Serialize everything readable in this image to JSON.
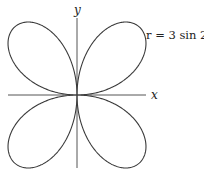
{
  "figure": {
    "equation_label": "r = 3 sin 2θ",
    "x_axis_label": "x",
    "y_axis_label": "y",
    "curve": {
      "type": "polar-rose",
      "expression": "r = 3 sin 2θ",
      "petals": 4,
      "amplitude": 3
    },
    "colors": {
      "curve": "#3a3a3a",
      "axis": "#555555",
      "background": "#ffffff"
    }
  },
  "chart_data": {
    "type": "line",
    "title": "",
    "xlabel": "x",
    "ylabel": "y",
    "annotations": [
      "r = 3 sin 2θ"
    ],
    "series": [
      {
        "name": "r = 3 sin 2θ",
        "description": "four-petal rose, petals in each quadrant, max r = 3 at θ = 45°, 135°, 225°, 315°"
      }
    ],
    "grid": false
  }
}
